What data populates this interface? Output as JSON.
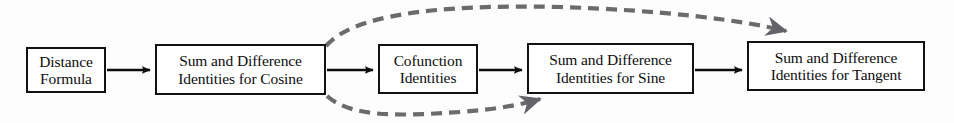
{
  "diagram": {
    "type": "flowchart",
    "background_color": "#fdfdfd",
    "box_border_color": "#121212",
    "solid_arrow_color": "#0d0d0d",
    "dashed_arrow_color": "#6b6b6b",
    "nodes": [
      {
        "id": "distance-formula",
        "lines": [
          "Distance",
          "Formula"
        ],
        "x": 26,
        "y": 47,
        "w": 80,
        "h": 46
      },
      {
        "id": "sum-difference-cosine",
        "lines": [
          "Sum and Difference",
          "Identities for Cosine"
        ],
        "x": 155,
        "y": 44,
        "w": 171,
        "h": 51
      },
      {
        "id": "cofunction-identities",
        "lines": [
          "Cofunction",
          "Identities"
        ],
        "x": 378,
        "y": 44,
        "w": 100,
        "h": 50
      },
      {
        "id": "sum-difference-sine",
        "lines": [
          "Sum and Difference",
          "Identities for Sine"
        ],
        "x": 527,
        "y": 43,
        "w": 167,
        "h": 51
      },
      {
        "id": "sum-difference-tangent",
        "lines": [
          "Sum and Difference",
          "Identities for Tangent"
        ],
        "x": 747,
        "y": 41,
        "w": 178,
        "h": 50
      }
    ],
    "solid_connectors": [
      {
        "id": "distance-to-cosine",
        "from": "distance-formula",
        "to": "sum-difference-cosine"
      },
      {
        "id": "cosine-to-cofunction",
        "from": "sum-difference-cosine",
        "to": "cofunction-identities"
      },
      {
        "id": "cofunction-to-sine",
        "from": "cofunction-identities",
        "to": "sum-difference-sine"
      },
      {
        "id": "sine-to-tangent",
        "from": "sum-difference-sine",
        "to": "sum-difference-tangent"
      }
    ],
    "dashed_connectors": [
      {
        "id": "cosine-to-tangent-upper",
        "from": "sum-difference-cosine",
        "to": "sum-difference-tangent"
      },
      {
        "id": "cosine-to-sine-lower",
        "from": "sum-difference-cosine",
        "to": "sum-difference-sine"
      }
    ]
  }
}
